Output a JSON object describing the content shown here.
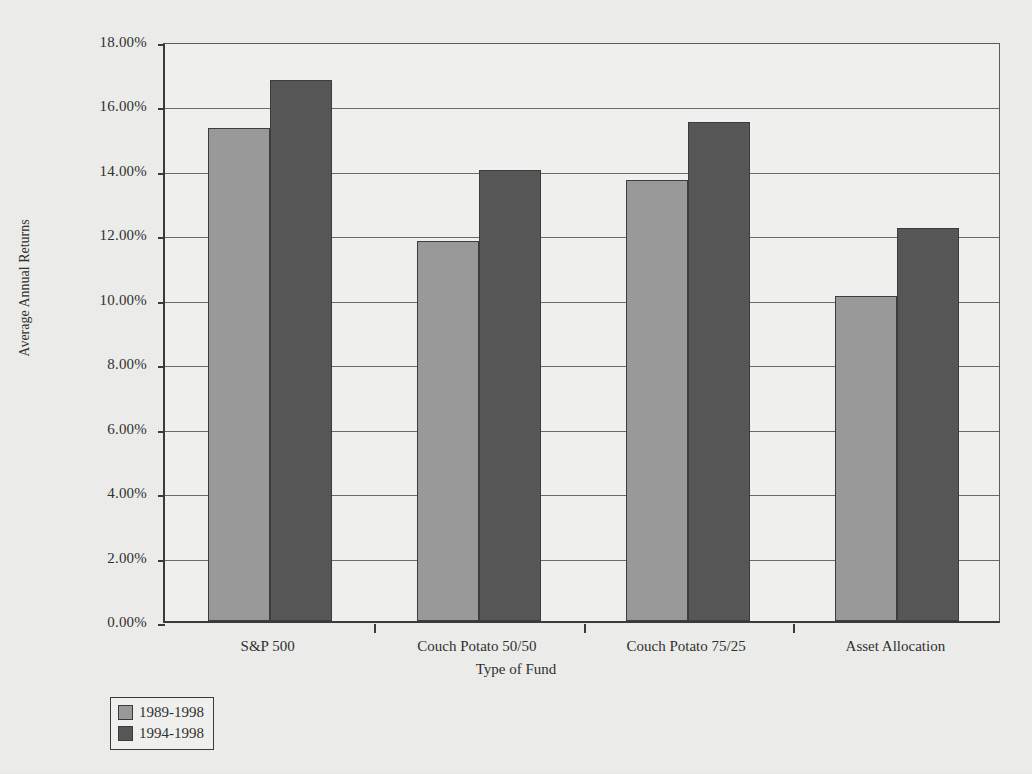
{
  "chart_data": {
    "type": "bar",
    "title": "",
    "xlabel": "Type of Fund",
    "ylabel": "Average Annual Returns",
    "categories": [
      "S&P 500",
      "Couch Potato 50/50",
      "Couch Potato 75/25",
      "Asset Allocation"
    ],
    "series": [
      {
        "name": "1989-1998",
        "color": "#9a9a9a",
        "values": [
          15.3,
          11.8,
          13.7,
          10.1
        ]
      },
      {
        "name": "1994-1998",
        "color": "#565656",
        "values": [
          16.8,
          14.0,
          15.5,
          12.2
        ]
      }
    ],
    "ylim": [
      0,
      18
    ],
    "ytick_step": 2,
    "ytick_labels": [
      "18.00%",
      "16.00%",
      "14.00%",
      "12.00%",
      "10.00%",
      "8.00%",
      "6.00%",
      "4.00%",
      "2.00%",
      "0.00%"
    ],
    "ytick_values": [
      18,
      16,
      14,
      12,
      10,
      8,
      6,
      4,
      2,
      0
    ],
    "grid": true,
    "legend_position": "bottom-left",
    "value_suffix": "%"
  },
  "legend": {
    "entries": [
      {
        "label": "1989-1998",
        "color": "#9a9a9a"
      },
      {
        "label": "1994-1998",
        "color": "#565656"
      }
    ]
  },
  "colors": {
    "series_1": "#9a9a9a",
    "series_2": "#565656",
    "axis": "#3a3a3a",
    "grid": "#6a6a6a",
    "background": "#eeeeec",
    "plot_background": "#f2f2f0"
  }
}
